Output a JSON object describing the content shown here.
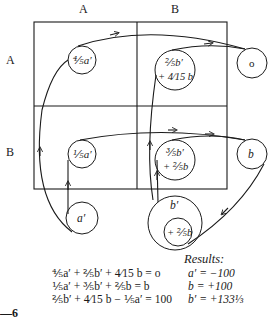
{
  "columns": [
    "A",
    "B"
  ],
  "rows": [
    "A",
    "B"
  ],
  "nodes": {
    "a_row_a": "⅘a′",
    "b_row_a_line1": "⅖b′",
    "b_row_a_line2": "+ 4⁄15 b",
    "sink_a": "o",
    "a_row_b": "⅕a′",
    "b_row_b_line1": "⅗b′",
    "b_row_b_line2": "+ ⅖b",
    "sink_b": "b",
    "source_a": "a′",
    "source_b": "b′",
    "source_b_inner": "+ ⅖b"
  },
  "equations": [
    "⅘a′ + ⅖b′ + 4⁄15 b = o",
    "⅕a′ + ⅗b′ + ⅖b  = b",
    "⅖b′ + 4⁄15 b − ⅕a′ = 100"
  ],
  "results": {
    "title": "Results:",
    "items": [
      "a′ = −100",
      "b = +100",
      "b′ = +133⅓"
    ]
  },
  "figure_label": "—6"
}
